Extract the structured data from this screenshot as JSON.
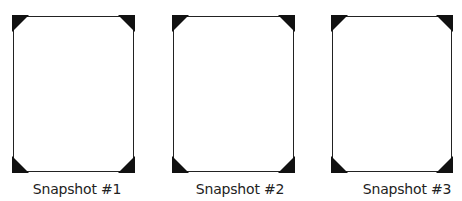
{
  "snapshots": [
    {
      "label": "Snapshot #1",
      "frame": {
        "left": 13,
        "top": 16,
        "width": 121,
        "height": 156
      },
      "caption_center_x": 77
    },
    {
      "label": "Snapshot #2",
      "frame": {
        "left": 173,
        "top": 16,
        "width": 121,
        "height": 156
      },
      "caption_center_x": 240
    },
    {
      "label": "Snapshot #3",
      "frame": {
        "left": 332,
        "top": 16,
        "width": 120,
        "height": 156
      },
      "caption_center_x": 407
    }
  ],
  "colors": {
    "frame_border": "#222222",
    "corner_fill": "#111111",
    "background": "#ffffff",
    "caption_text": "#222222"
  }
}
